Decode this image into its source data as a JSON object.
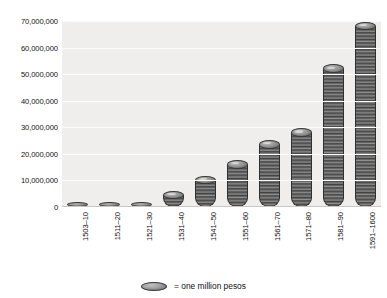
{
  "chart_data": {
    "type": "bar",
    "title": "",
    "subtitle": "",
    "xlabel": "",
    "ylabel": "",
    "categories": [
      "1503–10",
      "1511–20",
      "1521–30",
      "1531–40",
      "1541–50",
      "1551–60",
      "1561–70",
      "1571–80",
      "1581–90",
      "1591–1600"
    ],
    "values": [
      1500000,
      2000000,
      1500000,
      4500000,
      10000000,
      16000000,
      23500000,
      28000000,
      52000000,
      68000000
    ],
    "ylim": [
      0,
      70000000
    ],
    "ytick_values": [
      0,
      10000000,
      20000000,
      30000000,
      40000000,
      50000000,
      60000000,
      70000000
    ],
    "ytick_labels": [
      "0",
      "10,000,000",
      "20,000,000",
      "30,000,000",
      "40,000,000",
      "50,000,000",
      "60,000,000",
      "70,000,000"
    ],
    "grid": true,
    "legend_position": "bottom",
    "legend": [
      {
        "marker": "coin-icon",
        "label": "= one million pesos"
      }
    ],
    "annotations": [],
    "unit_note": "each coin in a stack represents one million pesos",
    "colors": {
      "plot_background": "#efeeec",
      "gridline": "#fbfbfa",
      "coin_dark": "#4a4a4a",
      "coin_light": "#bdbdbd",
      "coin_outline": "#3a3a3a",
      "text": "#111111",
      "page_background": "#ffffff"
    }
  }
}
